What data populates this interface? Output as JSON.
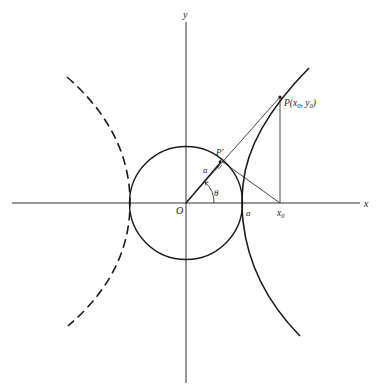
{
  "figure": {
    "type": "geometric construction of hyperbola (circle tangent construction)",
    "colors": {
      "ink": "#1a1a1a",
      "background": "#ffffff"
    },
    "axes": {
      "x_label": "x",
      "y_label": "y",
      "origin_label": "O"
    },
    "labels": {
      "point_P": "P(x",
      "point_P_sub0": "0",
      "point_P_mid": ", y",
      "point_P_sub1": "0",
      "point_P_end": ")",
      "point_P_prime": "P′",
      "radius_label": "a",
      "angle_label": "θ",
      "vertex_label": "a",
      "x0_label": "x",
      "x0_sub": "0"
    },
    "elements": [
      "x-axis",
      "y-axis",
      "circle of radius a centered at O",
      "right hyperbola branch (solid)",
      "left hyperbola branch (dashed)",
      "ray from O through P' to P",
      "tangent line from P' to x0",
      "vertical line from P down to x0",
      "angle arc theta"
    ]
  }
}
